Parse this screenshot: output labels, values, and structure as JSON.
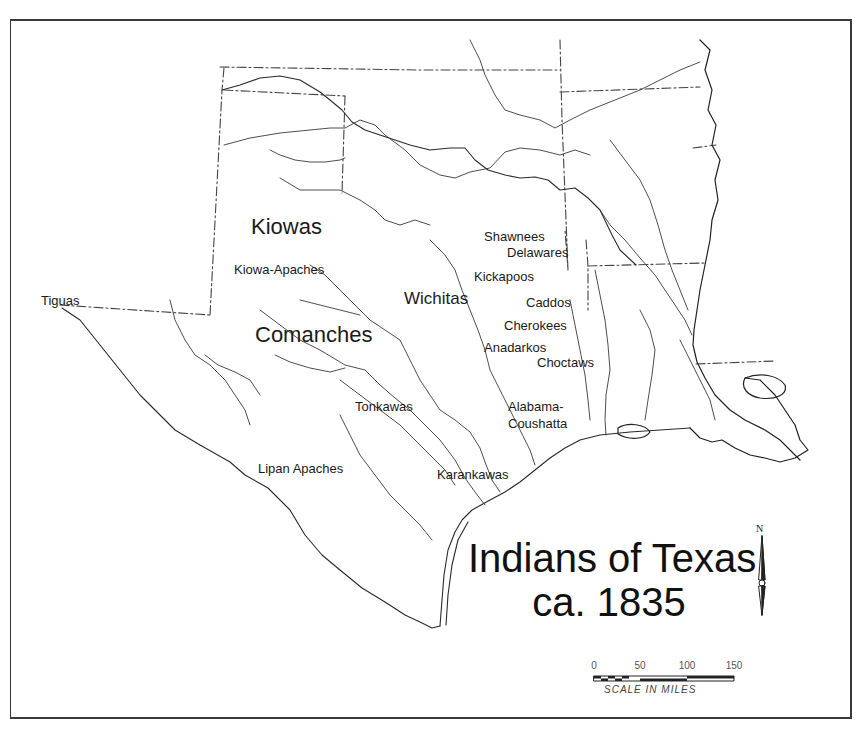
{
  "map": {
    "title_line1": "Indians of Texas",
    "title_line2": "ca. 1835",
    "colors": {
      "ink": "#1a1a1a",
      "line": "#333333",
      "background": "#ffffff"
    },
    "labels": {
      "tiguas": "Tiguas",
      "kiowas": "Kiowas",
      "kiowa_apaches": "Kiowa-Apaches",
      "comanches": "Comanches",
      "wichitas": "Wichitas",
      "shawnees": "Shawnees",
      "delawares": "Delawares",
      "kickapoos": "Kickapoos",
      "caddos": "Caddos",
      "cherokees": "Cherokees",
      "anadarkos": "Anadarkos",
      "choctaws": "Choctaws",
      "tonkawas": "Tonkawas",
      "alabama": "Alabama-",
      "coushatta": "Coushatta",
      "lipan_apaches": "Lipan Apaches",
      "karankawas": "Karankawas"
    },
    "scale": {
      "ticks": [
        "0",
        "50",
        "100",
        "150"
      ],
      "caption": "SCALE IN MILES"
    },
    "north_arrow": {
      "label": "N",
      "icon": "north-arrow-icon"
    }
  }
}
